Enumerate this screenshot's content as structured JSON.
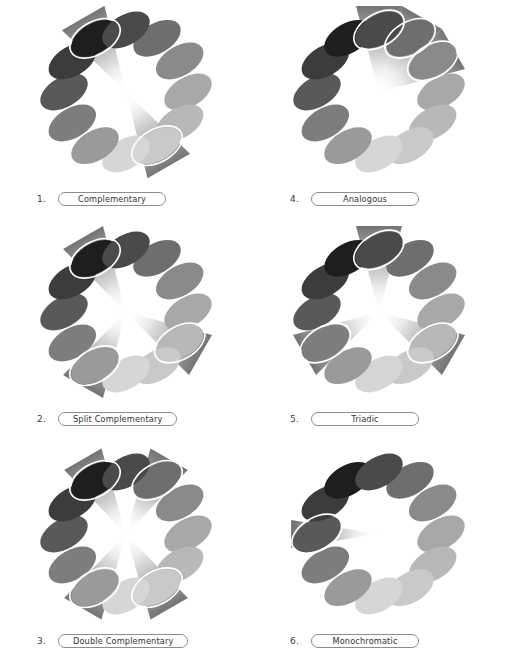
{
  "page": {
    "background": "#ffffff",
    "columns": 2,
    "rows": 3
  },
  "wheel": {
    "swatch_count": 12,
    "swatch_colors": [
      "#6e6e6e",
      "#8a8a8a",
      "#a8a8a8",
      "#b8b8b8",
      "#c9c9c9",
      "#d6d6d6",
      "#9a9a9a",
      "#7d7d7d",
      "#595959",
      "#3c3c3c",
      "#1e1e1e",
      "#4a4a4a"
    ],
    "swatch_angles_deg": [
      -60,
      -30,
      0,
      30,
      60,
      90,
      120,
      150,
      180,
      210,
      240,
      270
    ],
    "highlight_ring_color": "#ffffff",
    "wedge_fill_dark": "#707070",
    "wedge_fill_light": "#fdfdfd",
    "ellipse_rx": 26,
    "ellipse_ry": 15,
    "ellipse_tilt_deg": -30,
    "radius": 62,
    "center_x": 126,
    "center_y": 92
  },
  "schemes": [
    {
      "number": "1.",
      "name": "Complementary",
      "selected_indices": [
        10,
        4
      ],
      "wedge_half_angle": 16,
      "wedge_count": 2,
      "description": "Two swatches opposite on the wheel"
    },
    {
      "number": "2.",
      "name": "Split Complementary",
      "selected_indices": [
        10,
        3,
        6
      ],
      "wedge_half_angle": 15,
      "wedge_count": 3,
      "description": "One swatch plus two adjacent to its complement"
    },
    {
      "number": "3.",
      "name": "Double Complementary",
      "selected_indices": [
        10,
        0,
        4,
        6
      ],
      "wedge_half_angle": 14,
      "wedge_count": 4,
      "description": "Two complementary pairs"
    },
    {
      "number": "4.",
      "name": "Analogous",
      "selected_indices": [
        11,
        0,
        1
      ],
      "wedge_half_angle": 15,
      "wedge_count": 3,
      "description": "Three adjacent swatches"
    },
    {
      "number": "5.",
      "name": "Triadic",
      "selected_indices": [
        11,
        3,
        7
      ],
      "wedge_half_angle": 15,
      "wedge_count": 3,
      "description": "Three swatches evenly spaced 120 degrees apart"
    },
    {
      "number": "6.",
      "name": "Monochromatic",
      "selected_indices": [
        8
      ],
      "wedge_half_angle": 9,
      "wedge_count": 1,
      "description": "A single hue"
    }
  ]
}
